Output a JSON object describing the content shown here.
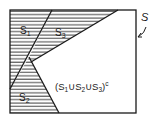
{
  "diagram": {
    "type": "venn-regions",
    "universe_label": "S",
    "regions": [
      {
        "id": "S1",
        "label": "S",
        "subscript": "1",
        "shaded": true
      },
      {
        "id": "S2",
        "label": "S",
        "subscript": "2",
        "shaded": true
      },
      {
        "id": "S3",
        "label": "S",
        "subscript": "3",
        "shaded": true
      },
      {
        "id": "complement",
        "label_parts": [
          "(S",
          "1",
          "∪S",
          "2",
          "∪S",
          "3",
          ")",
          "c"
        ],
        "shaded": false
      }
    ],
    "colors": {
      "line": "#1a1a1a",
      "hatch": "#2a2a2a",
      "background": "#ffffff"
    }
  }
}
